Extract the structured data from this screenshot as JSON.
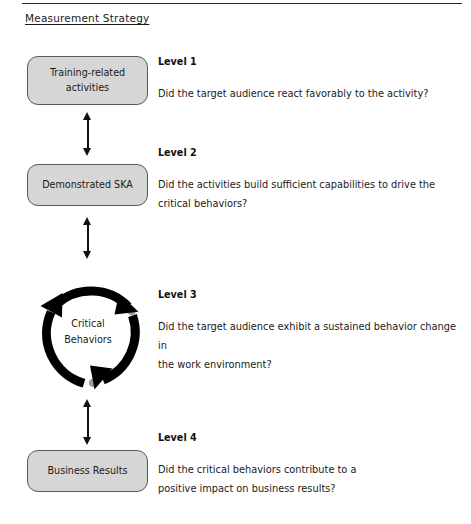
{
  "document": {
    "title": "Measurement Strategy",
    "has_top_rule": true,
    "title_underlined": true
  },
  "theme": {
    "box_fill": "#d6d6d6",
    "box_border": "#595959",
    "arrow_color": "#111111",
    "cycle_color": "#000000",
    "cycle_dot_color": "#9a9a9a",
    "text_color": "#1a1a1a",
    "rule_color": "#2b2b2b",
    "page_background": "#ffffff"
  },
  "levels": [
    {
      "id": "level-1",
      "heading": "Level 1",
      "node_label": "Training-related activities",
      "node_label_lines": [
        "Training-related",
        "activities"
      ],
      "node_shape": "rounded-rectangle",
      "question": "Did the target audience react favorably to the activity?",
      "question_lines": [
        "Did the target audience react favorably to the activity?"
      ]
    },
    {
      "id": "level-2",
      "heading": "Level 2",
      "node_label": "Demonstrated SKA",
      "node_label_lines": [
        "Demonstrated SKA"
      ],
      "node_shape": "rounded-rectangle",
      "question": "Did the activities build sufficient capabilities to drive the critical behaviors?",
      "question_lines": [
        "Did the activities build sufficient capabilities to drive the",
        "critical behaviors?"
      ]
    },
    {
      "id": "level-3",
      "heading": "Level 3",
      "node_label": "Critical Behaviors",
      "node_label_lines": [
        "Critical",
        "Behaviors"
      ],
      "node_shape": "cycle-circle",
      "question": "Did the target audience exhibit a sustained behavior change in the work environment?",
      "question_lines": [
        "Did the target audience exhibit a sustained behavior change in",
        "the work environment?"
      ]
    },
    {
      "id": "level-4",
      "heading": "Level 4",
      "node_label": "Business Results",
      "node_label_lines": [
        "Business Results"
      ],
      "node_shape": "rounded-rectangle",
      "question": "Did the critical behaviors contribute to a positive impact on business results?",
      "question_lines": [
        "Did the critical behaviors contribute to a",
        "positive impact on business results?"
      ]
    }
  ],
  "connectors": [
    {
      "id": "arrow-1-2",
      "from": "level-1",
      "to": "level-2",
      "style": "double-headed-vertical"
    },
    {
      "id": "arrow-2-3",
      "from": "level-2",
      "to": "level-3",
      "style": "double-headed-vertical"
    },
    {
      "id": "arrow-3-4",
      "from": "level-3",
      "to": "level-4",
      "style": "double-headed-vertical"
    }
  ],
  "cycle": {
    "direction": "clockwise",
    "arrowhead_count": 3,
    "arrowhead_positions": [
      "upper-right",
      "bottom",
      "upper-left"
    ]
  }
}
